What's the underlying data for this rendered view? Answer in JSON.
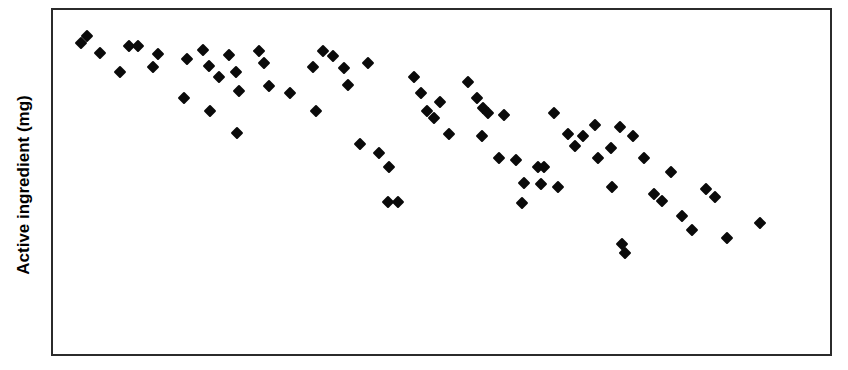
{
  "figure": {
    "background_color": "#ffffff",
    "frame_color": "#2b2b2b",
    "marker_color": "#0a0a0a"
  },
  "axes": {
    "ylabel": "Active ingredient (mg)",
    "xlabel": ""
  },
  "chart_data": {
    "type": "scatter",
    "title": "",
    "subtitle": "",
    "xlabel": "",
    "ylabel": "Active ingredient (mg)",
    "xlim": [
      0,
      100
    ],
    "ylim": [
      0,
      100
    ],
    "grid": false,
    "legend": null,
    "xticks": [],
    "yticks": [],
    "xticklabels": [],
    "yticklabels": [],
    "marker": "diamond",
    "marker_color": "#0a0a0a",
    "marker_size": 9,
    "n_points": 76,
    "series": [
      {
        "name": "Active ingredient",
        "points": [
          [
            3.6,
            90.5
          ],
          [
            4.4,
            92.5
          ],
          [
            6.1,
            87.5
          ],
          [
            8.6,
            82.0
          ],
          [
            9.8,
            89.5
          ],
          [
            11.0,
            89.5
          ],
          [
            12.9,
            83.5
          ],
          [
            13.5,
            87.2
          ],
          [
            17.2,
            85.8
          ],
          [
            19.3,
            88.5
          ],
          [
            20.1,
            83.8
          ],
          [
            21.3,
            80.5
          ],
          [
            22.6,
            86.8
          ],
          [
            23.5,
            82.0
          ],
          [
            26.5,
            88.0
          ],
          [
            27.2,
            84.5
          ],
          [
            27.8,
            78.0
          ],
          [
            24.0,
            76.5
          ],
          [
            33.5,
            83.5
          ],
          [
            34.8,
            88.0
          ],
          [
            36.0,
            86.5
          ],
          [
            37.4,
            83.0
          ],
          [
            38.0,
            78.2
          ],
          [
            40.5,
            84.5
          ],
          [
            33.9,
            70.5
          ],
          [
            20.2,
            70.5
          ],
          [
            23.7,
            64.2
          ],
          [
            46.4,
            80.5
          ],
          [
            47.3,
            76.0
          ],
          [
            48.1,
            70.5
          ],
          [
            49.8,
            73.4
          ],
          [
            53.4,
            79.0
          ],
          [
            54.6,
            74.5
          ],
          [
            55.4,
            71.5
          ],
          [
            56.0,
            70.0
          ],
          [
            58.0,
            69.5
          ],
          [
            51.0,
            64.0
          ],
          [
            55.2,
            63.5
          ],
          [
            57.4,
            57.0
          ],
          [
            59.6,
            56.5
          ],
          [
            62.4,
            54.5
          ],
          [
            63.2,
            54.5
          ],
          [
            60.6,
            49.8
          ],
          [
            60.4,
            44.0
          ],
          [
            43.3,
            54.5
          ],
          [
            43.1,
            44.2
          ],
          [
            44.4,
            44.2
          ],
          [
            64.5,
            70.0
          ],
          [
            66.3,
            64.0
          ],
          [
            68.2,
            63.5
          ],
          [
            69.8,
            66.5
          ],
          [
            70.2,
            57.0
          ],
          [
            71.8,
            60.0
          ],
          [
            72.0,
            48.5
          ],
          [
            73.0,
            66.0
          ],
          [
            74.6,
            63.5
          ],
          [
            76.0,
            57.0
          ],
          [
            77.4,
            46.5
          ],
          [
            78.4,
            44.5
          ],
          [
            79.6,
            53.0
          ],
          [
            81.0,
            40.0
          ],
          [
            82.2,
            36.0
          ],
          [
            84.0,
            48.0
          ],
          [
            85.2,
            45.5
          ],
          [
            86.8,
            33.8
          ],
          [
            91.0,
            38.0
          ],
          [
            73.2,
            32.0
          ],
          [
            73.6,
            29.5
          ],
          [
            67.2,
            60.5
          ],
          [
            62.8,
            49.5
          ],
          [
            65.0,
            48.5
          ],
          [
            49.0,
            68.5
          ],
          [
            42.0,
            58.5
          ],
          [
            39.5,
            61.0
          ],
          [
            30.5,
            76.0
          ],
          [
            16.8,
            74.5
          ]
        ]
      }
    ]
  }
}
